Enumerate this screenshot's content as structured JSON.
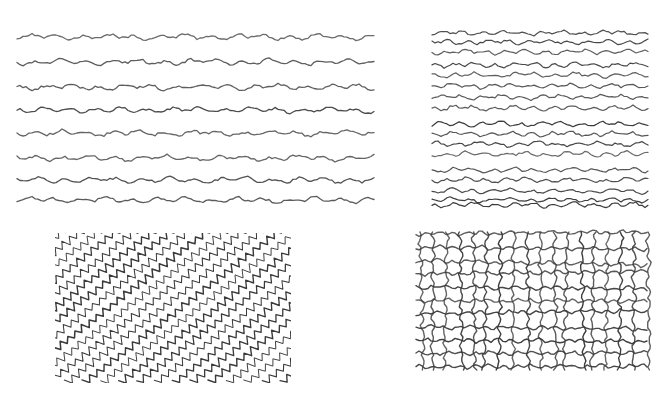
{
  "figure": {
    "background": "#ffffff",
    "stroke_color": "#3a3a3a",
    "caption": ""
  },
  "panels": [
    {
      "id": "top-left",
      "type": "horizontal-wavy-lines",
      "box": {
        "x": 15,
        "y": 25,
        "w": 362,
        "h": 185
      },
      "line_count": 8,
      "line_y": [
        37,
        62,
        87,
        110,
        133,
        158,
        180,
        200
      ],
      "x_range": [
        17,
        375
      ],
      "amplitude": 3,
      "wavelength": 26,
      "stroke_width": 1.3,
      "seed": 11
    },
    {
      "id": "top-right",
      "type": "horizontal-wavy-lines",
      "box": {
        "x": 430,
        "y": 25,
        "w": 220,
        "h": 185
      },
      "line_count": 17,
      "line_y": [
        33,
        42,
        52,
        65,
        75,
        86,
        97,
        108,
        124,
        134,
        144,
        154,
        170,
        180,
        191,
        200,
        205
      ],
      "x_range": [
        432,
        648
      ],
      "amplitude": 2.6,
      "wavelength": 20,
      "stroke_width": 1.2,
      "seed": 23
    },
    {
      "id": "bottom-left",
      "type": "diagonal-zigzag-lines",
      "box": {
        "x": 55,
        "y": 233,
        "w": 236,
        "h": 150
      },
      "line_count": 24,
      "angle_deg": -38,
      "amplitude": 3.4,
      "wavelength": 9,
      "stroke_width": 1.1,
      "seed": 37
    },
    {
      "id": "bottom-right",
      "type": "wavy-grid",
      "box": {
        "x": 414,
        "y": 230,
        "w": 236,
        "h": 142
      },
      "vertical_count": 18,
      "horizontal_count": 11,
      "amplitude": 2.2,
      "wavelength": 14,
      "stroke_width": 1.4,
      "seed": 53
    }
  ]
}
